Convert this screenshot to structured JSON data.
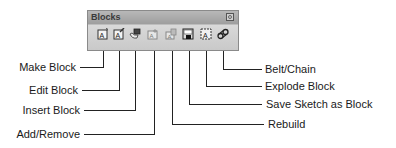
{
  "toolbar": {
    "title": "Blocks",
    "close_icon": "close-icon",
    "buttons": [
      {
        "id": "make-block",
        "label": "Make Block",
        "icon": "make-block-icon"
      },
      {
        "id": "edit-block",
        "label": "Edit Block",
        "icon": "edit-block-icon"
      },
      {
        "id": "insert-block",
        "label": "Insert Block",
        "icon": "insert-block-icon"
      },
      {
        "id": "add-remove",
        "label": "Add/Remove",
        "icon": "add-remove-icon"
      },
      {
        "id": "rebuild",
        "label": "Rebuild",
        "icon": "rebuild-icon"
      },
      {
        "id": "save-sketch-as-block",
        "label": "Save Sketch as Block",
        "icon": "save-sketch-icon"
      },
      {
        "id": "explode-block",
        "label": "Explode Block",
        "icon": "explode-block-icon"
      },
      {
        "id": "belt-chain",
        "label": "Belt/Chain",
        "icon": "belt-chain-icon"
      }
    ]
  },
  "callouts": {
    "left": [
      "Make Block",
      "Edit Block",
      "Insert Block",
      "Add/Remove"
    ],
    "right": [
      "Belt/Chain",
      "Explode Block",
      "Save Sketch as Block",
      "Rebuild"
    ]
  },
  "colors": {
    "panel_bg": "#d4d4d4",
    "titlebar_bg": "#a8a8a8",
    "line": "#222222",
    "text": "#1a1a1a"
  }
}
